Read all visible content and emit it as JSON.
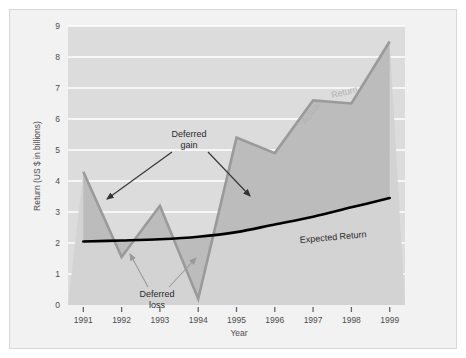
{
  "chart_data": {
    "type": "line",
    "title": "",
    "xlabel": "Year",
    "ylabel": "Return (US $ in billions)",
    "x": [
      1991,
      1992,
      1993,
      1994,
      1995,
      1996,
      1997,
      1998,
      1999
    ],
    "xticklabels": [
      "1991",
      "1992",
      "1993",
      "1994",
      "1995",
      "1996",
      "1997",
      "1998",
      "1999"
    ],
    "yticklabels": [
      "0",
      "1",
      "2",
      "3",
      "4",
      "5",
      "6",
      "7",
      "8",
      "9"
    ],
    "xlim": [
      1990.6,
      1999.4
    ],
    "ylim": [
      0,
      9
    ],
    "grid": true,
    "grid_axis": "y",
    "legend_position": "inline-along-line",
    "series": [
      {
        "name": "Actual Return",
        "color": "#9a9a9a",
        "values": [
          4.3,
          1.55,
          3.2,
          0.2,
          5.4,
          4.9,
          6.6,
          6.5,
          8.5
        ]
      },
      {
        "name": "Expected Return",
        "color": "#000000",
        "values": [
          2.05,
          2.08,
          2.12,
          2.2,
          2.35,
          2.6,
          2.85,
          3.15,
          3.45
        ]
      }
    ],
    "annotations": [
      {
        "label": "Deferred gain",
        "text_line1": "Deferred",
        "text_line2": "gain",
        "color": "#333333"
      },
      {
        "label": "Deferred loss",
        "text_line1": "Deferred",
        "text_line2": "loss",
        "color": "#8c8c8c"
      }
    ],
    "shaded_regions": [
      {
        "name": "deferred-gain-fill",
        "color": "#bcbcbc",
        "description": "area where actual return exceeds expected return"
      },
      {
        "name": "deferred-loss-fill",
        "color": "#d5d5d5",
        "description": "area where actual return falls below expected return"
      }
    ],
    "colors": {
      "plot_background": "#dcdcdc",
      "figure_background": "#f2f2f2",
      "gridline": "#ffffff",
      "actual_line": "#9a9a9a",
      "expected_line": "#000000",
      "gain_fill": "#bcbcbc",
      "text": "#4d4d4d"
    }
  },
  "labels": {
    "y_axis_title": "Return (US $ in billions)",
    "x_axis_title": "Year",
    "actual_return": "Actual Return",
    "actual_return_part1": "Actual",
    "actual_return_part2": "Return",
    "expected_return": "Expected Return",
    "deferred_gain_line1": "Deferred",
    "deferred_gain_line2": "gain",
    "deferred_loss_line1": "Deferred",
    "deferred_loss_line2": "loss"
  }
}
